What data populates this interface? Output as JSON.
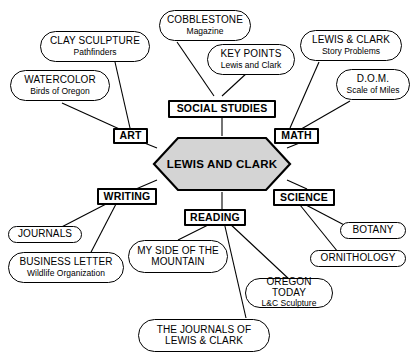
{
  "diagram": {
    "center": {
      "label": "LEWIS AND CLARK",
      "fill": "#d4d4d4",
      "stroke": "#000000"
    },
    "subjects": [
      {
        "id": "art",
        "label": "ART"
      },
      {
        "id": "social-studies",
        "label": "SOCIAL STUDIES"
      },
      {
        "id": "math",
        "label": "MATH"
      },
      {
        "id": "writing",
        "label": "WRITING"
      },
      {
        "id": "reading",
        "label": "READING"
      },
      {
        "id": "science",
        "label": "SCIENCE"
      }
    ],
    "leaves": [
      {
        "id": "clay-sculpture",
        "title": "CLAY SCULPTURE",
        "subtitle": "Pathfinders",
        "parent": "art"
      },
      {
        "id": "watercolor",
        "title": "WATERCOLOR",
        "subtitle": "Birds of Oregon",
        "parent": "art"
      },
      {
        "id": "cobblestone",
        "title": "COBBLESTONE",
        "subtitle": "Magazine",
        "parent": "social-studies"
      },
      {
        "id": "key-points",
        "title": "KEY POINTS",
        "subtitle": "Lewis and Clark",
        "parent": "social-studies"
      },
      {
        "id": "lewis-clark-story",
        "title": "LEWIS & CLARK",
        "subtitle": "Story Problems",
        "parent": "math"
      },
      {
        "id": "dom",
        "title": "D.O.M.",
        "subtitle": "Scale of Miles",
        "parent": "math"
      },
      {
        "id": "journals",
        "title": "JOURNALS",
        "subtitle": "",
        "parent": "writing"
      },
      {
        "id": "business-letter",
        "title": "BUSINESS LETTER",
        "subtitle": "Wildlife Organization",
        "parent": "writing"
      },
      {
        "id": "my-side",
        "title": "MY SIDE OF THE\nMOUNTAIN",
        "subtitle": "",
        "parent": "reading"
      },
      {
        "id": "oregon-today",
        "title": "OREGON TODAY",
        "subtitle": "L&C Sculpture",
        "parent": "reading"
      },
      {
        "id": "journals-of-lc",
        "title": "THE JOURNALS OF\nLEWIS & CLARK",
        "subtitle": "",
        "parent": "reading"
      },
      {
        "id": "botany",
        "title": "BOTANY",
        "subtitle": "",
        "parent": "science"
      },
      {
        "id": "ornithology",
        "title": "ORNITHOLOGY",
        "subtitle": "",
        "parent": "science"
      }
    ]
  }
}
